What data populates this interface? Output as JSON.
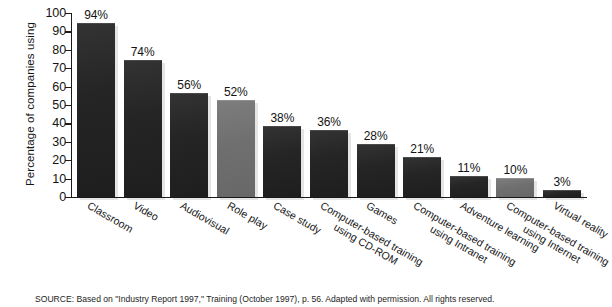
{
  "chart_data": {
    "type": "bar",
    "title": "",
    "xlabel": "",
    "ylabel": "Percentage of companies using",
    "ylim": [
      0,
      100
    ],
    "ytick_step": 10,
    "grid": false,
    "legend": "none",
    "categories": [
      "Classroom",
      "Video",
      "Audiovisual",
      "Role play",
      "Case study",
      "Computer-based training using CD-ROM",
      "Games",
      "Computer-based training using Intranet",
      "Adventure learning",
      "Computer-based training using Internet",
      "Virtual reality"
    ],
    "values": [
      94,
      74,
      56,
      52,
      38,
      36,
      28,
      21,
      11,
      10,
      3
    ],
    "value_labels": [
      "94%",
      "74%",
      "56%",
      "52%",
      "38%",
      "36%",
      "28%",
      "21%",
      "11%",
      "10%",
      "3%"
    ],
    "bar_colors": [
      "dark",
      "dark",
      "dark",
      "gray",
      "dark",
      "dark",
      "dark",
      "dark",
      "dark",
      "gray",
      "dark"
    ]
  },
  "axis": {
    "y_title": "Percentage of companies using",
    "y_ticks": [
      "100",
      "90",
      "80",
      "70",
      "60",
      "50",
      "40",
      "30",
      "20",
      "10",
      "0"
    ]
  },
  "categories_display": [
    {
      "line1": "Classroom",
      "line2": ""
    },
    {
      "line1": "Video",
      "line2": ""
    },
    {
      "line1": "Audiovisual",
      "line2": ""
    },
    {
      "line1": "Role play",
      "line2": ""
    },
    {
      "line1": "Case study",
      "line2": ""
    },
    {
      "line1": "Computer-based training",
      "line2": "using CD-ROM"
    },
    {
      "line1": "Games",
      "line2": ""
    },
    {
      "line1": "Computer-based training",
      "line2": "using Intranet"
    },
    {
      "line1": "Adventure learning",
      "line2": ""
    },
    {
      "line1": "Computer-based training",
      "line2": "using Internet"
    },
    {
      "line1": "Virtual reality",
      "line2": ""
    }
  ],
  "footer": {
    "source": "SOURCE: Based on \"Industry Report 1997,\" Training (October 1997), p. 56. Adapted with permission. All rights reserved."
  },
  "colors": {
    "bar_dark": "#232323",
    "bar_gray": "#6f6f6f",
    "axis": "#1b1b1b",
    "text": "#151515",
    "background": "#ffffff"
  }
}
